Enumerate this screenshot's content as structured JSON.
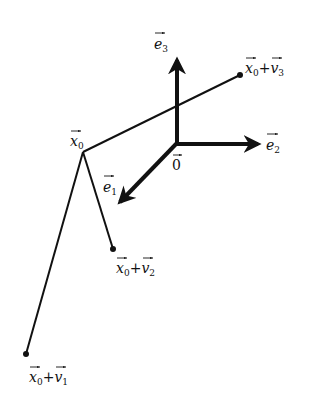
{
  "diagram": {
    "origin_label": "0",
    "basis_vectors": [
      {
        "id": "e1",
        "base": "e",
        "sub": "1",
        "direction": "down-left (toward viewer)"
      },
      {
        "id": "e2",
        "base": "e",
        "sub": "2",
        "direction": "right"
      },
      {
        "id": "e3",
        "base": "e",
        "sub": "3",
        "direction": "up"
      }
    ],
    "base_point": {
      "id": "x0",
      "base": "x",
      "sub": "0"
    },
    "affine_points": [
      {
        "id": "x0+v1",
        "parts": [
          {
            "base": "x",
            "sub": "0"
          },
          {
            "op": "+"
          },
          {
            "base": "v",
            "sub": "1"
          }
        ]
      },
      {
        "id": "x0+v2",
        "parts": [
          {
            "base": "x",
            "sub": "0"
          },
          {
            "op": "+"
          },
          {
            "base": "v",
            "sub": "2"
          }
        ]
      },
      {
        "id": "x0+v3",
        "parts": [
          {
            "base": "x",
            "sub": "0"
          },
          {
            "op": "+"
          },
          {
            "base": "v",
            "sub": "3"
          }
        ]
      }
    ],
    "colors": {
      "ink": "#111111",
      "background": "#ffffff"
    }
  }
}
